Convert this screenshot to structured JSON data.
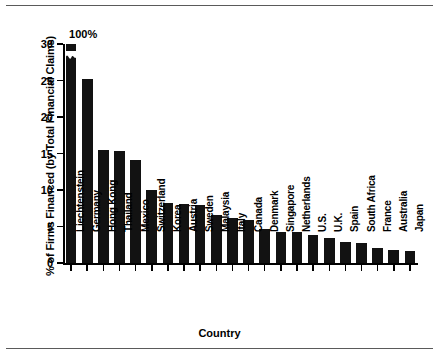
{
  "chart_data": {
    "type": "bar",
    "title": "",
    "xlabel": "Country",
    "ylabel": "% of Firms Financed (by Total Financial Claims)",
    "ylim": [
      0,
      30
    ],
    "yticks": [
      0,
      5,
      10,
      15,
      20,
      25,
      30
    ],
    "ytick_labels": [
      "0",
      "5",
      "10",
      "15",
      "20",
      "25",
      "30"
    ],
    "grid": false,
    "legend": null,
    "axis_break": {
      "series_index": 0,
      "note": "First bar is truncated with a break notch; its true value is annotated above the axis.",
      "annotation": "100%"
    },
    "annotations": [
      {
        "text": "100%",
        "category": "Liechtenstein",
        "value": 100
      }
    ],
    "categories": [
      "Liechtenstein",
      "Germany",
      "Hong Kong",
      "Thailand",
      "Mexico",
      "Switzerland",
      "Korea",
      "Austria",
      "Sweden",
      "Malaysia",
      "Italy",
      "Canada",
      "Denmark",
      "Singapore",
      "Netherlands",
      "U.S.",
      "U.K.",
      "Spain",
      "South Africa",
      "France",
      "Australia",
      "Japan"
    ],
    "values": [
      100,
      25.2,
      15.5,
      15.4,
      14.1,
      10.0,
      8.2,
      8.1,
      7.9,
      6.6,
      6.1,
      5.9,
      4.6,
      4.2,
      4.2,
      3.9,
      3.4,
      2.9,
      2.8,
      2.0,
      1.8,
      1.6
    ],
    "bar_color": "#121212"
  }
}
